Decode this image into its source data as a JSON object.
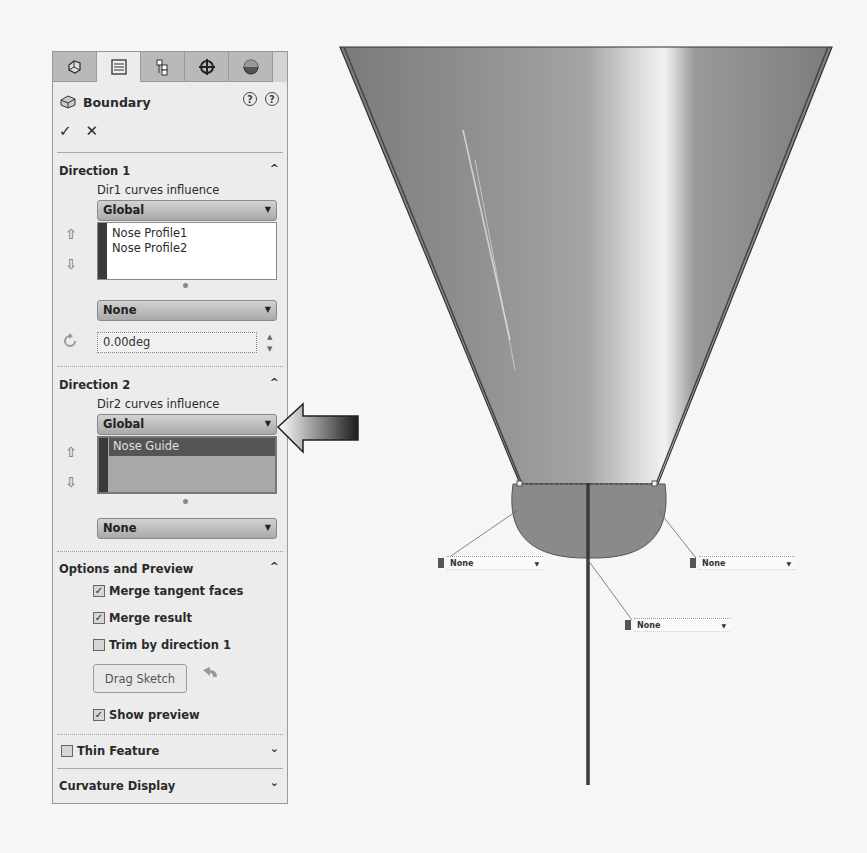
{
  "panel": {
    "tabs": [
      {
        "name": "feature-manager",
        "icon": "feature-manager-icon"
      },
      {
        "name": "property-manager",
        "icon": "property-manager-icon",
        "active": true
      },
      {
        "name": "configuration-manager",
        "icon": "configuration-manager-icon"
      },
      {
        "name": "dimxpert-manager",
        "icon": "dimxpert-icon"
      },
      {
        "name": "display-manager",
        "icon": "display-manager-icon"
      }
    ],
    "title": "Boundary",
    "help_labels": [
      "?",
      "?"
    ],
    "ok_label": "✓",
    "cancel_label": "✕",
    "direction1": {
      "title": "Direction 1",
      "influence_label": "Dir1 curves influence",
      "influence_value": "Global",
      "curves": [
        "Nose Profile1",
        "Nose Profile2"
      ],
      "tangency_value": "None",
      "angle_value": "0.00deg"
    },
    "direction2": {
      "title": "Direction 2",
      "influence_label": "Dir2 curves influence",
      "influence_value": "Global",
      "curves": [
        "Nose Guide"
      ],
      "tangency_value": "None"
    },
    "options": {
      "title": "Options and Preview",
      "merge_tangent_faces": {
        "label": "Merge tangent faces",
        "checked": true,
        "mark": "✓"
      },
      "merge_result": {
        "label": "Merge result",
        "checked": true,
        "mark": "✓"
      },
      "trim_by_direction1": {
        "label": "Trim by direction 1",
        "checked": false,
        "mark": ""
      },
      "drag_sketch_label": "Drag Sketch",
      "show_preview": {
        "label": "Show preview",
        "checked": true,
        "mark": "✓"
      }
    },
    "thin_feature": {
      "label": "Thin Feature",
      "checked": false
    },
    "curvature_display": {
      "label": "Curvature Display"
    },
    "chevron_up": "^",
    "chevron_down": "⌄",
    "arrow_up": "⇧",
    "arrow_down": "⇩",
    "dropdown_arrow": "▼"
  },
  "graphics": {
    "tags": [
      {
        "value": "None"
      },
      {
        "value": "None"
      },
      {
        "value": "None"
      }
    ]
  },
  "colors": {
    "panel_bg": "#ececec",
    "selection_bg": "#555555",
    "surface": "#8c8c8c"
  }
}
